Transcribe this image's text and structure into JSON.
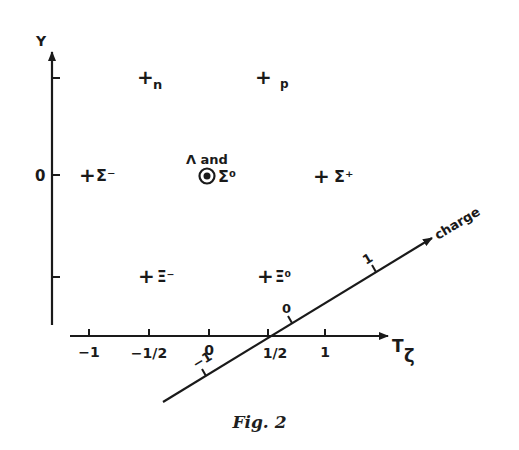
{
  "figure": {
    "caption": "Fig. 2",
    "y_axis": {
      "label": "Y",
      "ticks": [
        {
          "value": 1,
          "label": ""
        },
        {
          "value": 0,
          "label": "0"
        },
        {
          "value": -1,
          "label": ""
        }
      ]
    },
    "x_axis": {
      "label_main": "T",
      "label_sub": "ζ",
      "ticks": [
        {
          "value": -1,
          "label": "−1"
        },
        {
          "value": -0.5,
          "label": "−1/2"
        },
        {
          "value": 0,
          "label": "0"
        },
        {
          "value": 0.5,
          "label": "1/2"
        },
        {
          "value": 1,
          "label": "1"
        }
      ]
    },
    "charge_axis": {
      "label": "charge",
      "ticks": [
        {
          "value": -1,
          "label": "−1"
        },
        {
          "value": 0,
          "label": "0"
        },
        {
          "value": 1,
          "label": "1"
        }
      ]
    },
    "particles": [
      {
        "name": "n",
        "T": -0.5,
        "Y": 1,
        "marker": "+"
      },
      {
        "name": "p",
        "T": 0.5,
        "Y": 1,
        "marker": "+"
      },
      {
        "name": "Σ⁻",
        "T": -1,
        "Y": 0,
        "marker": "+"
      },
      {
        "name": "Λ and Σ⁰",
        "T": 0,
        "Y": 0,
        "marker": "⊚",
        "label_top": "Λ and",
        "label_right": "Σ⁰"
      },
      {
        "name": "Σ⁺",
        "T": 1,
        "Y": 0,
        "marker": "+"
      },
      {
        "name": "Ξ⁻",
        "T": -0.5,
        "Y": -1,
        "marker": "+"
      },
      {
        "name": "Ξ⁰",
        "T": 0.5,
        "Y": -1,
        "marker": "+"
      }
    ]
  }
}
